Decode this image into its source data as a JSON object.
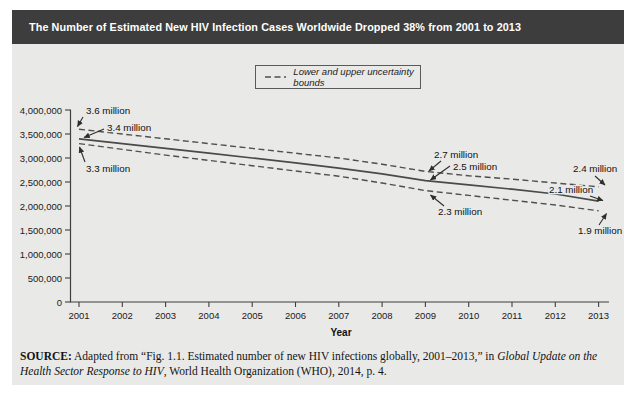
{
  "title": "The Number of Estimated New HIV Infection Cases Worldwide Dropped 38% from 2001 to 2013",
  "legend": {
    "label": "Lower and upper uncertainty bounds"
  },
  "chart_data": {
    "type": "line",
    "title": "The Number of Estimated New HIV Infection Cases Worldwide Dropped 38% from 2001 to 2013",
    "xlabel": "Year",
    "ylabel": "",
    "x_tick_labels": [
      "2001",
      "2002",
      "2003",
      "2004",
      "2005",
      "2006",
      "2007",
      "2008",
      "2009",
      "2010",
      "2011",
      "2012",
      "2013"
    ],
    "y_tick_labels": [
      "4,000,000",
      "3,500,000",
      "3,000,000",
      "2,500,000",
      "2,000,000",
      "1,500,000",
      "1,000,000",
      "500,000",
      "0"
    ],
    "ylim": [
      0,
      4000000
    ],
    "grid": false,
    "legend_position": "top-center",
    "series": [
      {
        "name": "Estimated new HIV infections",
        "style": "solid",
        "values_millions": [
          3.4,
          3.3,
          3.2,
          3.1,
          3.0,
          2.9,
          2.79,
          2.67,
          2.53,
          2.44,
          2.35,
          2.25,
          2.1
        ]
      },
      {
        "name": "Upper uncertainty bound",
        "style": "dashed",
        "values_millions": [
          3.6,
          3.5,
          3.4,
          3.3,
          3.2,
          3.1,
          3.0,
          2.87,
          2.72,
          2.63,
          2.56,
          2.48,
          2.4
        ]
      },
      {
        "name": "Lower uncertainty bound",
        "style": "dashed",
        "values_millions": [
          3.3,
          3.18,
          3.06,
          2.95,
          2.84,
          2.73,
          2.62,
          2.48,
          2.32,
          2.22,
          2.12,
          2.02,
          1.9
        ]
      }
    ],
    "labeled_points": [
      {
        "year": "2001",
        "upper": "3.6 million",
        "estimate": "3.4 million",
        "lower": "3.3 million"
      },
      {
        "year": "2009",
        "upper": "2.7 million",
        "estimate": "2.5 million",
        "lower": "2.3 million"
      },
      {
        "year": "2013",
        "upper": "2.4 million",
        "estimate": "2.1 million",
        "lower": "1.9 million"
      }
    ],
    "annotations": [
      {
        "label": "3.6 million"
      },
      {
        "label": "3.4 million"
      },
      {
        "label": "3.3 million"
      },
      {
        "label": "2.7 million"
      },
      {
        "label": "2.5 million"
      },
      {
        "label": "2.3 million"
      },
      {
        "label": "2.4 million"
      },
      {
        "label": "2.1 million"
      },
      {
        "label": "1.9 million"
      }
    ]
  },
  "source": {
    "prefix": "SOURCE:",
    "part1": " Adapted from “Fig. 1.1. Estimated number of new HIV infections globally, 2001–2013,” in ",
    "italic": "Global Update on the Health Sector Response to HIV",
    "part2": ", World Health Organization (WHO), 2014, p. 4."
  },
  "colors": {
    "title_bar": "#3d3d3d",
    "panel_background": "#e9e9e8",
    "line": "#4a4a4a",
    "text": "#1a1a1a"
  }
}
